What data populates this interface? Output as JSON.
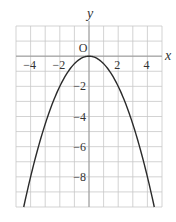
{
  "chart_data": {
    "type": "line",
    "title": "",
    "function": "y = -1/2 x^2",
    "xlabel": "x",
    "ylabel": "y",
    "origin_label": "O",
    "xlim": [
      -5,
      5
    ],
    "ylim": [
      -10,
      2
    ],
    "grid": true,
    "x_ticks": [
      -4,
      -2,
      2,
      4
    ],
    "x_tick_labels": [
      "−4",
      "−2",
      "2",
      "4"
    ],
    "y_ticks": [
      -2,
      -4,
      -6,
      -8
    ],
    "y_tick_labels": [
      "−2",
      "−4",
      "−6",
      "−8"
    ],
    "series": [
      {
        "name": "parabola",
        "x": [
          -4.47,
          -4,
          -3,
          -2,
          -1,
          0,
          1,
          2,
          3,
          4,
          4.47
        ],
        "y": [
          -10,
          -8,
          -4.5,
          -2,
          -0.5,
          0,
          -0.5,
          -2,
          -4.5,
          -8,
          -10
        ]
      }
    ],
    "colors": {
      "grid": "#c8c8c8",
      "curve": "#2a2a2a",
      "text": "#333333"
    }
  }
}
